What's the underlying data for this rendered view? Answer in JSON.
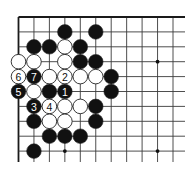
{
  "diagram": {
    "type": "go-board-corner",
    "grid": {
      "origin_x": 18.5,
      "origin_y": 17,
      "dx": 15.45,
      "dy": 14.9,
      "cols": 12,
      "rows": 10,
      "right_extent": 185,
      "bottom_extent": 162,
      "edges": [
        "top",
        "left"
      ],
      "line_color": "#3a3a3a",
      "edge_color": "#1a1a1a"
    },
    "star_points": [
      {
        "col": 9,
        "row": 3
      },
      {
        "col": 9,
        "row": 9
      },
      {
        "col": 3,
        "row": 9
      }
    ],
    "stones": [
      {
        "col": 3,
        "row": 1,
        "color": "black"
      },
      {
        "col": 5,
        "row": 1,
        "color": "black"
      },
      {
        "col": 1,
        "row": 2,
        "color": "black"
      },
      {
        "col": 2,
        "row": 2,
        "color": "black"
      },
      {
        "col": 3,
        "row": 2,
        "color": "white"
      },
      {
        "col": 4,
        "row": 2,
        "color": "black"
      },
      {
        "col": 0,
        "row": 3,
        "color": "white"
      },
      {
        "col": 1,
        "row": 3,
        "color": "white"
      },
      {
        "col": 3,
        "row": 3,
        "color": "white"
      },
      {
        "col": 4,
        "row": 3,
        "color": "black"
      },
      {
        "col": 5,
        "row": 3,
        "color": "black"
      },
      {
        "col": 0,
        "row": 4,
        "color": "white",
        "label": "6"
      },
      {
        "col": 1,
        "row": 4,
        "color": "black",
        "label": "7"
      },
      {
        "col": 2,
        "row": 4,
        "color": "white"
      },
      {
        "col": 3,
        "row": 4,
        "color": "white",
        "label": "2"
      },
      {
        "col": 4,
        "row": 4,
        "color": "white"
      },
      {
        "col": 5,
        "row": 4,
        "color": "white"
      },
      {
        "col": 6,
        "row": 4,
        "color": "black"
      },
      {
        "col": 0,
        "row": 5,
        "color": "black",
        "label": "5"
      },
      {
        "col": 1,
        "row": 5,
        "color": "white"
      },
      {
        "col": 2,
        "row": 5,
        "color": "black"
      },
      {
        "col": 3,
        "row": 5,
        "color": "black",
        "label": "1"
      },
      {
        "col": 6,
        "row": 5,
        "color": "black"
      },
      {
        "col": 1,
        "row": 6,
        "color": "black",
        "label": "3"
      },
      {
        "col": 2,
        "row": 6,
        "color": "white",
        "label": "4"
      },
      {
        "col": 3,
        "row": 6,
        "color": "white"
      },
      {
        "col": 4,
        "row": 6,
        "color": "white"
      },
      {
        "col": 5,
        "row": 6,
        "color": "black"
      },
      {
        "col": 1,
        "row": 7,
        "color": "black"
      },
      {
        "col": 2,
        "row": 7,
        "color": "white"
      },
      {
        "col": 3,
        "row": 7,
        "color": "white"
      },
      {
        "col": 5,
        "row": 7,
        "color": "black"
      },
      {
        "col": 2,
        "row": 8,
        "color": "black"
      },
      {
        "col": 3,
        "row": 8,
        "color": "black"
      },
      {
        "col": 4,
        "row": 8,
        "color": "black"
      },
      {
        "col": 1,
        "row": 9,
        "color": "black"
      }
    ],
    "move_labels": [
      "1",
      "2",
      "3",
      "4",
      "5",
      "6",
      "7"
    ],
    "colors": {
      "black_stone": "#111111",
      "white_stone": "#ffffff",
      "stone_outline": "#222222",
      "label_on_black": "#ffffff",
      "label_on_white": "#111111",
      "background": "#ffffff"
    }
  }
}
